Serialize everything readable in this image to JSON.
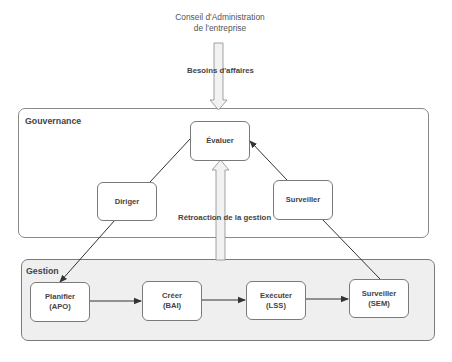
{
  "board": {
    "line1": "Conseil d'Administration",
    "line2": "de l'entreprise"
  },
  "business_needs_label": "Besoins d'affaires",
  "governance": {
    "title": "Gouvernance",
    "nodes": {
      "evaluate": "Évaluer",
      "direct": "Diriger",
      "monitor": "Surveiller"
    }
  },
  "feedback_label": "Rétroaction de la gestion",
  "management": {
    "title": "Gestion",
    "nodes": [
      {
        "name": "Planifier",
        "code": "(APO)"
      },
      {
        "name": "Créer",
        "code": "(BAI)"
      },
      {
        "name": "Exécuter",
        "code": "(LSS)"
      },
      {
        "name": "Surveiller",
        "code": "(SEM)"
      }
    ]
  },
  "colors": {
    "management_bg": "#efefef",
    "border": "#7a7a7a",
    "arrow": "#333333",
    "hollow_arrow_fill": "#f2f2f2"
  }
}
